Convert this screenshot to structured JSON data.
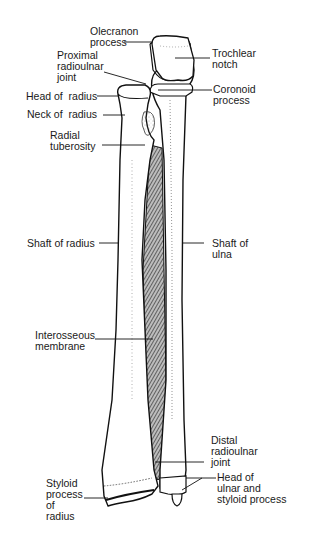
{
  "diagram": {
    "labels": {
      "olecranon_process": "Olecranon\nprocess",
      "trochlear_notch": "Trochlear\nnotch",
      "proximal_radioulnar_joint": "Proximal\nradioulnar\njoint",
      "head_of_radius": "Head of  radius",
      "coronoid_process": "Coronoid\nprocess",
      "neck_of_radius": "Neck of  radius",
      "radial_tuberosity": "Radial\ntuberosity",
      "shaft_of_radius": "Shaft of radius",
      "shaft_of_ulna": "Shaft of\nulna",
      "interosseous_membrane": "Interosseous\nmembrane",
      "distal_radioulnar_joint": "Distal\nradioulnar\njoint",
      "head_of_ulnar_and_styloid_process": "Head of\nulnar and\nstyloid process",
      "styloid_process_of_radius": "Styloid\nprocess\nof\nradius"
    },
    "colors": {
      "ink": "#1a1a1a",
      "bone_fill": "#ffffff",
      "background": "#ffffff",
      "stipple": "#555555"
    }
  }
}
